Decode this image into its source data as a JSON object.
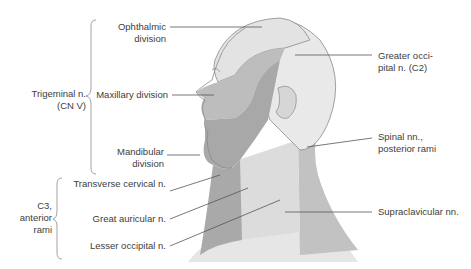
{
  "figure": {
    "colors": {
      "background": "#ffffff",
      "ophthalmic": "#e3e3e3",
      "maxillary": "#bdbdbd",
      "mandibular": "#a8a8a8",
      "occipital": "#e9e9e9",
      "posterior_rami": "#c2c2c2",
      "neck_anterior": "#a9a9a9",
      "cervical_light": "#dcdcdc",
      "supraclavicular": "#e6e6e6",
      "outline": "#8a8a8a",
      "leader_line": "#555555",
      "text": "#3d3d3d"
    },
    "groups": [
      {
        "id": "trigeminal",
        "label_line1": "Trigeminal n.",
        "label_line2": "(CN V)"
      },
      {
        "id": "c3",
        "label_line1": "C3,",
        "label_line2": "anterior",
        "label_line3": "rami"
      }
    ],
    "labels": {
      "ophthalmic_1": "Ophthalmic",
      "ophthalmic_2": "division",
      "maxillary": "Maxillary division",
      "mandibular_1": "Mandibular",
      "mandibular_2": "division",
      "transverse_cervical": "Transverse cervical n.",
      "great_auricular": "Great auricular n.",
      "lesser_occipital": "Lesser occipital n.",
      "greater_occipital_1": "Greater occi-",
      "greater_occipital_2": "pital n. (C2)",
      "spinal_1": "Spinal nn.,",
      "spinal_2": "posterior rami",
      "supraclavicular": "Supraclavicular nn."
    }
  }
}
